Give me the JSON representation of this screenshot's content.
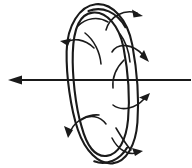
{
  "figure": {
    "kind": "physics-field-diagram",
    "title": "",
    "background_color": "#ffffff",
    "stroke_color": "#1a1a1a",
    "canvas": {
      "width": 192,
      "height": 168
    }
  },
  "axis": {
    "name": "horizontal-axis",
    "label": "",
    "direction": "left",
    "y": 80,
    "x_start": 190,
    "x_end": 10,
    "arrowhead": "left",
    "stroke_width": 2.2
  },
  "torus": {
    "name": "torus-ring",
    "label": "",
    "center": {
      "x": 102,
      "y": 82
    },
    "outer": {
      "rx": 32,
      "ry": 80
    },
    "inner": {
      "rx": 23.5,
      "ry": 69
    },
    "tilt_deg": -6,
    "stroke_width": 2.1
  },
  "flow_arrows": {
    "name": "circulation-arrows",
    "count": 6,
    "description": "",
    "items": [
      {
        "name": "flow-arrow-top-right",
        "side": "right",
        "direction": "up-right"
      },
      {
        "name": "flow-arrow-upper-right",
        "side": "right",
        "direction": "right"
      },
      {
        "name": "flow-arrow-lower-right",
        "side": "right",
        "direction": "right"
      },
      {
        "name": "flow-arrow-bottom-right",
        "side": "right",
        "direction": "down-right"
      },
      {
        "name": "flow-arrow-upper-left",
        "side": "left",
        "direction": "left"
      },
      {
        "name": "flow-arrow-lower-left",
        "side": "left",
        "direction": "down-left"
      }
    ]
  },
  "legend": {
    "visible": false,
    "entries": []
  },
  "annotations": []
}
